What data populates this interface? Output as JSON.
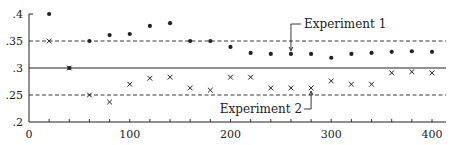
{
  "chart_data": {
    "type": "scatter",
    "title": "",
    "xlabel": "",
    "ylabel": "",
    "xlim": [
      0,
      400
    ],
    "ylim": [
      0.2,
      0.4
    ],
    "x_ticks": [
      0,
      100,
      200,
      300,
      400
    ],
    "x_tick_labels": [
      "0",
      "100",
      "200",
      "300",
      "400"
    ],
    "x_minor_step": 20,
    "y_ticks": [
      0.2,
      0.25,
      0.3,
      0.35,
      0.4
    ],
    "y_tick_labels": [
      ".2",
      ".25",
      ".3",
      ".35",
      ".4"
    ],
    "grid": false,
    "legend": "none (inline callout labels)",
    "x": [
      20,
      40,
      60,
      80,
      100,
      120,
      140,
      160,
      180,
      200,
      220,
      240,
      260,
      280,
      300,
      320,
      340,
      360,
      380,
      400
    ],
    "series": [
      {
        "name": "Experiment 1",
        "marker": "dot",
        "values": [
          0.4,
          0.3,
          0.35,
          0.361,
          0.363,
          0.378,
          0.383,
          0.35,
          0.35,
          0.339,
          0.328,
          0.326,
          0.326,
          0.326,
          0.319,
          0.326,
          0.328,
          0.33,
          0.331,
          0.33
        ]
      },
      {
        "name": "Experiment 2",
        "marker": "x",
        "values": [
          0.35,
          0.3,
          0.25,
          0.237,
          0.27,
          0.281,
          0.283,
          0.263,
          0.259,
          0.283,
          0.283,
          0.263,
          0.263,
          0.263,
          0.276,
          0.27,
          0.27,
          0.291,
          0.293,
          0.291
        ]
      }
    ],
    "reference_lines": [
      {
        "y": 0.35,
        "style": "dashed"
      },
      {
        "y": 0.3,
        "style": "solid"
      },
      {
        "y": 0.25,
        "style": "dashed"
      }
    ],
    "annotations": [
      {
        "text": "Experiment 1",
        "points_to": {
          "x": 260,
          "y": 0.326
        }
      },
      {
        "text": "Experiment 2",
        "points_to": {
          "x": 280,
          "y": 0.263
        }
      }
    ]
  },
  "colors": {
    "ink": "#222222",
    "background": "#ffffff"
  }
}
